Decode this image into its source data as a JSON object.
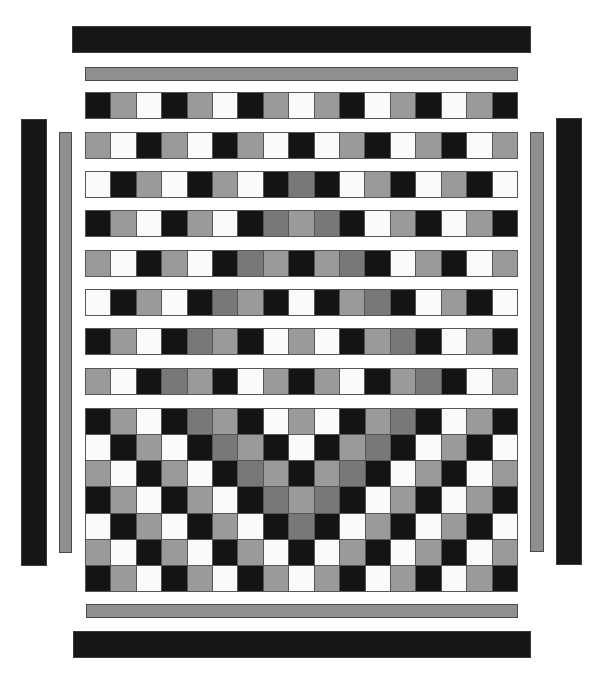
{
  "colors": {
    "B": "#141414",
    "G": "#9a9a9a",
    "D": "#787878",
    "W": "#fafafa",
    "bar_black": "#161616",
    "bar_gray": "#8f8f8f"
  },
  "legend": {
    "B": "black",
    "G": "light-gray",
    "D": "dark-gray",
    "W": "white"
  },
  "frame": {
    "top_black_bar": {
      "x": 72,
      "y": 26,
      "w": 459,
      "h": 27
    },
    "top_gray_bar": {
      "x": 85,
      "y": 67,
      "w": 433,
      "h": 14
    },
    "bottom_gray_bar": {
      "x": 86,
      "y": 604,
      "w": 432,
      "h": 14
    },
    "bottom_black_bar": {
      "x": 73,
      "y": 631,
      "w": 458,
      "h": 27
    },
    "left_black_bar": {
      "x": 21,
      "y": 119,
      "w": 26,
      "h": 447
    },
    "left_gray_bar": {
      "x": 59,
      "y": 132,
      "w": 13,
      "h": 421
    },
    "right_gray_bar": {
      "x": 530,
      "y": 132,
      "w": 14,
      "h": 420
    },
    "right_black_bar": {
      "x": 556,
      "y": 118,
      "w": 26,
      "h": 447
    }
  },
  "strips": [
    {
      "top": 92,
      "cells": "BGWBGWBGWGBWGBWGB"
    },
    {
      "top": 132,
      "cells": "GWBGWBGWBWGBWGBWG"
    },
    {
      "top": 171,
      "cells": "WBGWBGWBDBWGBWGBW"
    },
    {
      "top": 210,
      "cells": "BGWBGWBDGDBWGBWGB"
    },
    {
      "top": 250,
      "cells": "GWBGWBDGBGDBWGBWG"
    },
    {
      "top": 289,
      "cells": "WBGWBDGBWBGDBWGBW"
    },
    {
      "top": 328,
      "cells": "BGWBDGBWGWBGDBWGB"
    },
    {
      "top": 368,
      "cells": "GWBDGBWGBGWBGDBWG"
    }
  ],
  "block": {
    "rows": [
      "BGWBDGBWGWBGDBWGB",
      "WBGWBDGBWBGDBWGBW",
      "GWBGWBDGBGDBWGBWG",
      "BGWBGWBDGDBWGBWGB",
      "WBGWBGWBDBWGBWGBW",
      "GWBGWBGWBWGBWGBWG",
      "BGWBGWBGWGBWGBWGB"
    ]
  }
}
